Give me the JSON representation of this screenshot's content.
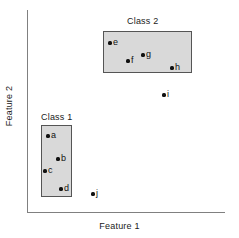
{
  "chart_data": {
    "type": "scatter",
    "title": "",
    "xlabel": "Feature 1",
    "ylabel": "Feature 2",
    "grid": false,
    "legend": "none",
    "axes": {
      "x_ticks": [],
      "y_ticks": [],
      "x_range_px": [
        27,
        225
      ],
      "y_range_px": [
        10,
        212
      ]
    },
    "points": [
      {
        "label": "a",
        "x": 48,
        "y": 136
      },
      {
        "label": "b",
        "x": 58,
        "y": 159
      },
      {
        "label": "c",
        "x": 45,
        "y": 171
      },
      {
        "label": "d",
        "x": 61,
        "y": 189
      },
      {
        "label": "e",
        "x": 110,
        "y": 43
      },
      {
        "label": "f",
        "x": 128,
        "y": 61
      },
      {
        "label": "g",
        "x": 143,
        "y": 55
      },
      {
        "label": "h",
        "x": 172,
        "y": 68
      },
      {
        "label": "i",
        "x": 164,
        "y": 95
      },
      {
        "label": "j",
        "x": 93,
        "y": 194
      }
    ],
    "regions": [
      {
        "name": "Class 1",
        "members": [
          "a",
          "b",
          "c",
          "d"
        ],
        "x": 41,
        "y": 125,
        "width": 31,
        "height": 72,
        "title_x": 41,
        "title_y": 112,
        "fill": "#d9d9d9",
        "stroke": "#555555"
      },
      {
        "name": "Class 2",
        "members": [
          "e",
          "f",
          "g",
          "h"
        ],
        "x": 103,
        "y": 31,
        "width": 89,
        "height": 42,
        "title_x": 127,
        "title_y": 16,
        "fill": "#d9d9d9",
        "stroke": "#555555"
      }
    ],
    "outliers": [
      "i",
      "j"
    ],
    "colors": {
      "point": "#111111",
      "axis": "#808080",
      "text": "#1a1a1a",
      "region_fill": "#d9d9d9",
      "region_stroke": "#555555",
      "background": "#ffffff"
    }
  }
}
